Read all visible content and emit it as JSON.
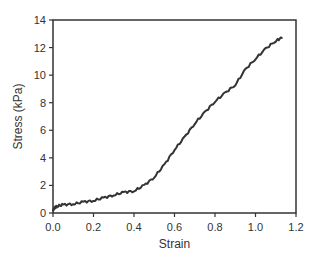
{
  "chart_data": {
    "type": "line",
    "title": "",
    "xlabel": "Strain",
    "ylabel": "Stress (kPa)",
    "xlim": [
      0,
      1.2
    ],
    "ylim": [
      0,
      14
    ],
    "xticks": [
      0.0,
      0.2,
      0.4,
      0.6,
      0.8,
      1.0,
      1.2
    ],
    "xtick_labels": [
      "0.0",
      "0.2",
      "0.4",
      "0.6",
      "0.8",
      "1.0",
      "1.2"
    ],
    "yticks": [
      0,
      2,
      4,
      6,
      8,
      10,
      12,
      14
    ],
    "ytick_labels": [
      "0",
      "2",
      "4",
      "6",
      "8",
      "10",
      "12",
      "14"
    ],
    "grid": false,
    "legend": null,
    "series": [
      {
        "name": "stress-strain",
        "color": "#333333",
        "x": [
          0.0,
          0.01,
          0.02,
          0.05,
          0.1,
          0.15,
          0.2,
          0.25,
          0.3,
          0.35,
          0.4,
          0.45,
          0.5,
          0.55,
          0.6,
          0.65,
          0.7,
          0.75,
          0.8,
          0.85,
          0.9,
          0.95,
          1.0,
          1.05,
          1.1,
          1.13
        ],
        "y": [
          0.2,
          0.4,
          0.5,
          0.6,
          0.65,
          0.8,
          0.9,
          1.1,
          1.3,
          1.5,
          1.6,
          2.0,
          2.6,
          3.5,
          4.6,
          5.5,
          6.5,
          7.3,
          8.1,
          8.7,
          9.3,
          10.4,
          11.2,
          11.9,
          12.5,
          12.7
        ]
      }
    ]
  },
  "colors": {
    "axis": "#333333",
    "line": "#333333",
    "background": "#ffffff"
  }
}
